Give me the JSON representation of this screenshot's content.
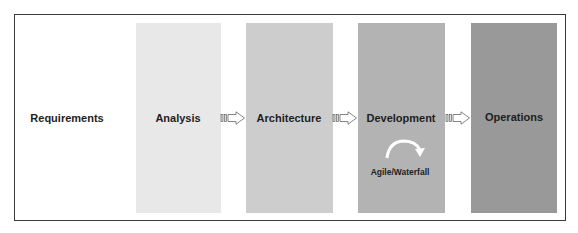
{
  "stages": [
    {
      "label": "Requirements",
      "color": "#ffffff"
    },
    {
      "label": "Analysis",
      "color": "#e8e8e8"
    },
    {
      "label": "Architecture",
      "color": "#cdcdcd"
    },
    {
      "label": "Development",
      "color": "#b3b3b3"
    },
    {
      "label": "Operations",
      "color": "#999999"
    }
  ],
  "development_note": "Agile/Waterfall",
  "icons": {
    "flow_arrow": "block-arrow-right-icon",
    "cycle_arrow": "curved-arrow-icon"
  }
}
